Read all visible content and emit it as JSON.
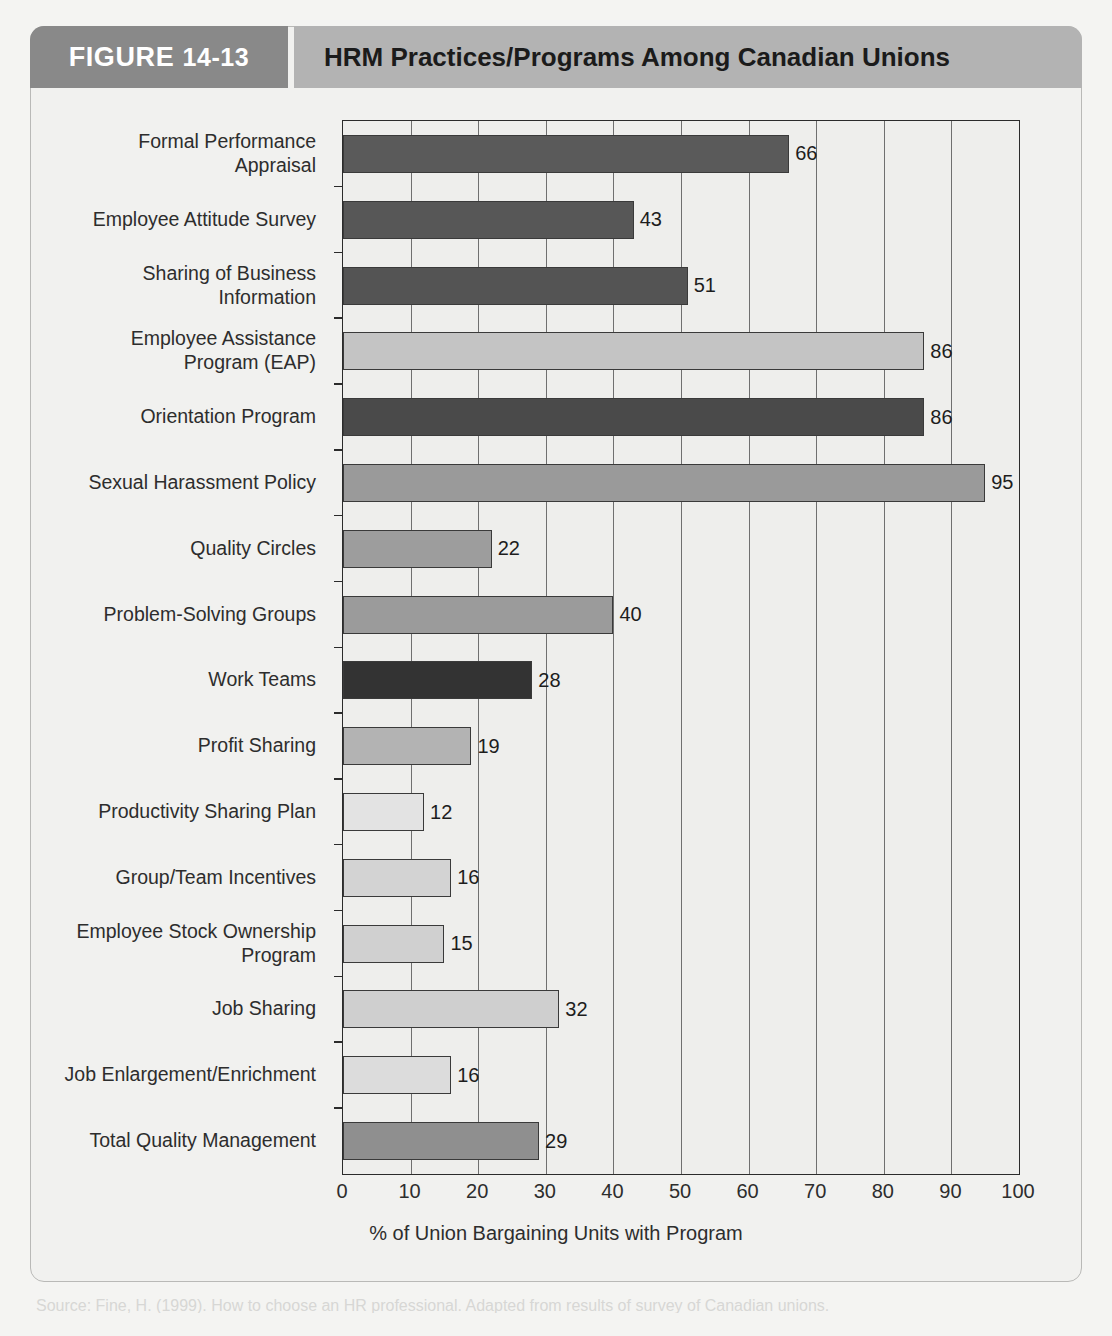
{
  "header": {
    "figure_label": "FIGURE",
    "figure_number": "14-13",
    "title": "HRM Practices/Programs Among Canadian Unions"
  },
  "caption": "Source: Fine, H. (1999). How to choose an HR professional. Adapted from results of survey of Canadian unions.",
  "colors": {
    "tab_bg": "#898989",
    "title_bg": "#b3b3b3",
    "panel_bg": "#f1f1ef",
    "plot_bg": "#eeeeec",
    "axis": "#2b2b2b",
    "grid": "#6f6f6f",
    "bar_darkest": "#333333",
    "bar_dark": "#555555",
    "bar_medium": "#8c8c8c",
    "bar_light": "#c0c0c0",
    "bar_lighter": "#d2d2d2",
    "bar_lightest": "#e2e2e2"
  },
  "chart_data": {
    "type": "bar",
    "orientation": "horizontal",
    "title": "HRM Practices/Programs Among Canadian Unions",
    "xlabel": "% of Union Bargaining Units with Program",
    "ylabel": "",
    "xlim": [
      0,
      100
    ],
    "xticks": [
      "0",
      "10",
      "20",
      "30",
      "40",
      "50",
      "60",
      "70",
      "80",
      "90",
      "100"
    ],
    "grid": true,
    "legend": "none",
    "categories": [
      "Formal Performance Appraisal",
      "Employee Attitude Survey",
      "Sharing of Business Information",
      "Employee Assistance Program (EAP)",
      "Orientation Program",
      "Sexual Harassment Policy",
      "Quality Circles",
      "Problem-Solving Groups",
      "Work Teams",
      "Profit Sharing",
      "Productivity Sharing Plan",
      "Group/Team Incentives",
      "Employee Stock Ownership Program",
      "Job Sharing",
      "Job Enlargement/Enrichment",
      "Total Quality Management"
    ],
    "values": [
      66,
      43,
      51,
      86,
      86,
      95,
      22,
      40,
      28,
      19,
      12,
      16,
      15,
      32,
      16,
      29
    ],
    "bars": [
      {
        "label": "Formal Performance\nAppraisal",
        "label_lines": [
          "Formal Performance",
          "Appraisal"
        ],
        "value": 66,
        "color": "#5a5a5a"
      },
      {
        "label": "Employee Attitude Survey",
        "label_lines": [
          "Employee Attitude Survey"
        ],
        "value": 43,
        "color": "#575757"
      },
      {
        "label": "Sharing of Business\nInformation",
        "label_lines": [
          "Sharing of Business",
          "Information"
        ],
        "value": 51,
        "color": "#545454"
      },
      {
        "label": "Employee Assistance\nProgram (EAP)",
        "label_lines": [
          "Employee Assistance",
          "Program (EAP)"
        ],
        "value": 86,
        "color": "#c4c4c4"
      },
      {
        "label": "Orientation Program",
        "label_lines": [
          "Orientation Program"
        ],
        "value": 86,
        "color": "#4a4a4a"
      },
      {
        "label": "Sexual Harassment Policy",
        "label_lines": [
          "Sexual Harassment Policy"
        ],
        "value": 95,
        "color": "#9a9a9a"
      },
      {
        "label": "Quality Circles",
        "label_lines": [
          "Quality Circles"
        ],
        "value": 22,
        "color": "#9d9d9d"
      },
      {
        "label": "Problem-Solving Groups",
        "label_lines": [
          "Problem-Solving Groups"
        ],
        "value": 40,
        "color": "#9b9b9b"
      },
      {
        "label": "Work Teams",
        "label_lines": [
          "Work Teams"
        ],
        "value": 28,
        "color": "#333333"
      },
      {
        "label": "Profit Sharing",
        "label_lines": [
          "Profit Sharing"
        ],
        "value": 19,
        "color": "#b3b3b3"
      },
      {
        "label": "Productivity Sharing Plan",
        "label_lines": [
          "Productivity Sharing Plan"
        ],
        "value": 12,
        "color": "#e3e3e3"
      },
      {
        "label": "Group/Team Incentives",
        "label_lines": [
          "Group/Team Incentives"
        ],
        "value": 16,
        "color": "#d3d3d3"
      },
      {
        "label": "Employee Stock Ownership\nProgram",
        "label_lines": [
          "Employee Stock Ownership",
          "Program"
        ],
        "value": 15,
        "color": "#d0d0d0"
      },
      {
        "label": "Job Sharing",
        "label_lines": [
          "Job Sharing"
        ],
        "value": 32,
        "color": "#cfcfcf"
      },
      {
        "label": "Job Enlargement/Enrichment",
        "label_lines": [
          "Job Enlargement/Enrichment"
        ],
        "value": 16,
        "color": "#dcdcdc"
      },
      {
        "label": "Total Quality Management",
        "label_lines": [
          "Total Quality Management"
        ],
        "value": 29,
        "color": "#8f8f8f"
      }
    ]
  }
}
